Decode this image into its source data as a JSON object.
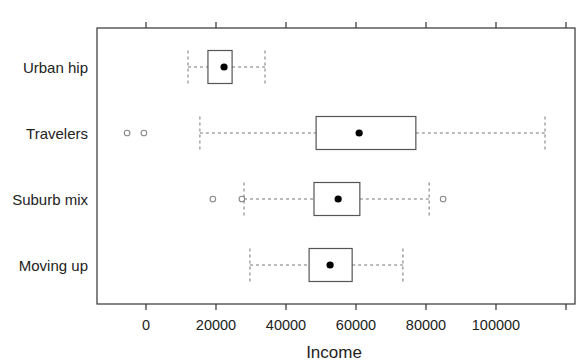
{
  "chart_data": {
    "type": "boxplot",
    "orientation": "horizontal",
    "title": "",
    "xlabel": "Income",
    "ylabel": "",
    "xlim": [
      -14000,
      122000
    ],
    "x_ticks": [
      0,
      20000,
      40000,
      60000,
      80000,
      100000,
      120000
    ],
    "x_tick_labels": [
      "0",
      "20000",
      "40000",
      "60000",
      "80000",
      "100000",
      ""
    ],
    "top_axis_ticks": [
      0,
      20000,
      40000,
      60000,
      80000,
      100000,
      120000
    ],
    "grid": false,
    "legend": null,
    "categories": [
      "Urban hip",
      "Travelers",
      "Suburb mix",
      "Moving up"
    ],
    "series": [
      {
        "name": "Urban hip",
        "whisker_low": 12000,
        "q1": 17700,
        "median": 22300,
        "q3": 24600,
        "whisker_high": 34000,
        "outliers": []
      },
      {
        "name": "Travelers",
        "whisker_low": 15400,
        "q1": 48600,
        "median": 60900,
        "q3": 77100,
        "whisker_high": 114000,
        "outliers": [
          -5400,
          -600
        ]
      },
      {
        "name": "Suburb mix",
        "whisker_low": 28000,
        "q1": 48000,
        "median": 54900,
        "q3": 61100,
        "whisker_high": 80900,
        "outliers": [
          19100,
          27400,
          84900
        ]
      },
      {
        "name": "Moving up",
        "whisker_low": 29700,
        "q1": 46600,
        "median": 52600,
        "q3": 58900,
        "whisker_high": 73400,
        "outliers": []
      }
    ]
  },
  "colors": {
    "frame": "#333333",
    "box": "#555555",
    "whisker": "#777777",
    "outlier": "#888888",
    "median_dot": "#000000",
    "text": "#222222"
  }
}
